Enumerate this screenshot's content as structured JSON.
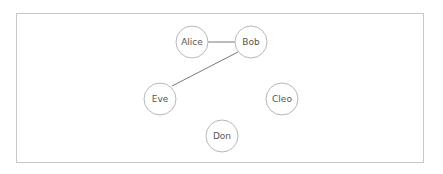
{
  "graph": {
    "nodes": [
      {
        "id": "alice",
        "label": "Alice",
        "x": 192,
        "y": 42
      },
      {
        "id": "bob",
        "label": "Bob",
        "x": 251,
        "y": 42
      },
      {
        "id": "eve",
        "label": "Eve",
        "x": 160,
        "y": 99
      },
      {
        "id": "cleo",
        "label": "Cleo",
        "x": 282,
        "y": 99
      },
      {
        "id": "don",
        "label": "Don",
        "x": 222,
        "y": 136
      }
    ],
    "edges": [
      {
        "from": "alice",
        "to": "bob"
      },
      {
        "from": "bob",
        "to": "eve"
      }
    ],
    "node_radius": 16,
    "colors": {
      "node_stroke": "#b8b8b8",
      "edge": "#7a7a7a",
      "border": "#c8c8c8",
      "text": "#555555"
    }
  }
}
